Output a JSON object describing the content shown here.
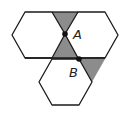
{
  "diagram": {
    "colors": {
      "stroke": "#1a1a1a",
      "shade": "#8c8c8c",
      "background": "#ffffff"
    },
    "points": [
      {
        "name": "A",
        "label": "A"
      },
      {
        "name": "B",
        "label": "B"
      }
    ]
  }
}
